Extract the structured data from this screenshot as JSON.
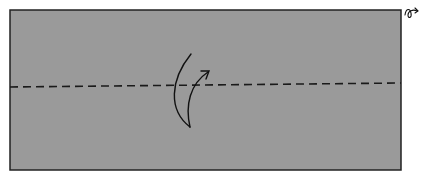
{
  "diagram": {
    "type": "origami-fold-step",
    "paper": {
      "color": "#9a9a9a",
      "border_color": "#222222",
      "x": 10,
      "y": 10,
      "width": 391,
      "height": 160
    },
    "fold_line": {
      "style": "dashed",
      "kind": "valley-fold",
      "x1": 10,
      "y1": 87,
      "x2": 401,
      "y2": 83
    },
    "arrow": {
      "kind": "fold-over-arrow",
      "direction": "up"
    },
    "corner_symbol": {
      "name": "turn-over-icon",
      "description": "turn over symbol"
    }
  }
}
